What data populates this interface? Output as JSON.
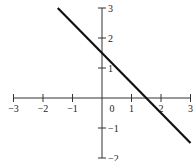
{
  "chart_data": {
    "type": "line",
    "title": "",
    "xlabel": "",
    "ylabel": "",
    "xlim": [
      -3,
      3
    ],
    "ylim": [
      -2,
      3
    ],
    "grid": false,
    "x_ticks": [
      -3,
      -2,
      -1,
      1,
      2,
      3
    ],
    "x_tick_labels": [
      "−3",
      "−2",
      "−1",
      "1",
      "2",
      "3"
    ],
    "y_ticks": [
      -2,
      -1,
      1,
      2,
      3
    ],
    "y_tick_labels": [
      "−2",
      "−1",
      "1",
      "2",
      "3"
    ],
    "origin_label": "0",
    "series": [
      {
        "name": "y = -x + 1.5",
        "slope": -1,
        "intercept": 1.5,
        "x": [
          -1.5,
          3.0
        ],
        "y": [
          3.0,
          -1.5
        ],
        "color": "#111111"
      }
    ]
  }
}
